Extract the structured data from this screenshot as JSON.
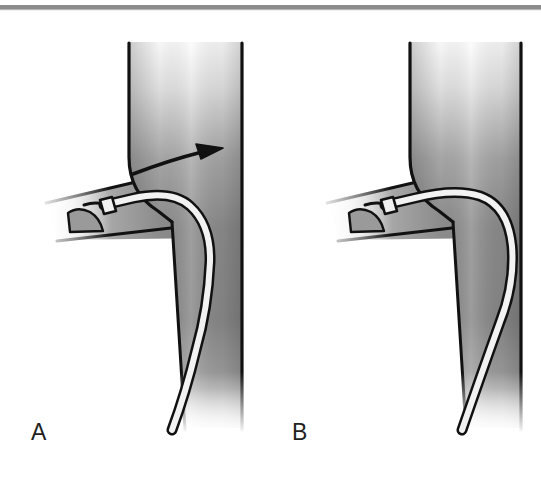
{
  "figure": {
    "type": "medical-illustration",
    "panel_count": 2,
    "top_rule": {
      "color": "#8c8c8c",
      "description": "thin horizontal gray rule across top of figure"
    },
    "colors": {
      "vessel_light": "#fbfbfb",
      "vessel_mid": "#8e8e8e",
      "vessel_dark": "#6f6f6f",
      "outline": "#111111",
      "catheter_core": "#f2f2f2",
      "catheter_outline": "#111111",
      "arrow": "#111111",
      "label_text": "#231f20",
      "background": "#ffffff"
    },
    "panels": [
      {
        "id": "A",
        "label": "A",
        "has_flow_arrow": true,
        "arrow_name": "flow-direction-arrow",
        "arrow_description": "curved arrow sweeping rightward and upward into the main vessel",
        "catheter_description": "catheter entering from the left tributary, tip beveled near the valve, shaft curving centrally down the main vessel",
        "valve_description": "small crescent-shaped venous valve cusp at the tributary ostium",
        "vessel_description": "vertical main vein with an oblique tributary joining from the left"
      },
      {
        "id": "B",
        "label": "B",
        "has_flow_arrow": false,
        "arrow_name": null,
        "arrow_description": "",
        "catheter_description": "catheter entering from the left tributary, tip beveled near the valve, shaft hugging the right wall of the main vessel",
        "valve_description": "small crescent-shaped venous valve cusp at the tributary ostium",
        "vessel_description": "vertical main vein with an oblique tributary joining from the left"
      }
    ]
  }
}
